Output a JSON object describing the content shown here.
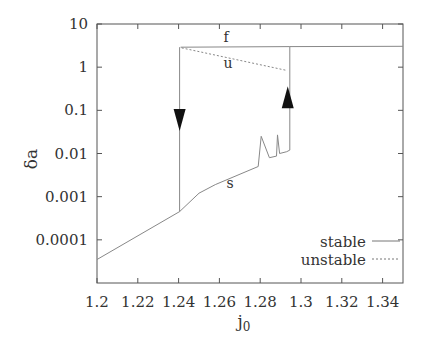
{
  "chart_data": {
    "type": "line",
    "title": "",
    "xlabel": "j0",
    "xlabel_main": "j",
    "xlabel_sub": "0",
    "ylabel": "δa",
    "xscale": "linear",
    "yscale": "log",
    "xlim": [
      1.2,
      1.35
    ],
    "ylim": [
      1e-05,
      10
    ],
    "x_ticks": [
      1.2,
      1.22,
      1.24,
      1.26,
      1.28,
      1.3,
      1.32,
      1.34
    ],
    "x_tick_labels": [
      "1.2",
      "1.22",
      "1.24",
      "1.26",
      "1.28",
      "1.3",
      "1.32",
      "1.34"
    ],
    "y_ticks": [
      10,
      1,
      0.1,
      0.01,
      0.001,
      0.0001
    ],
    "y_tick_labels": [
      "10",
      "1",
      "0.1",
      "0.01",
      "0.001",
      "0.0001"
    ],
    "grid": false,
    "legend_position": "lower right",
    "legend": [
      {
        "label": "stable",
        "style": "solid"
      },
      {
        "label": "unstable",
        "style": "dashed"
      }
    ],
    "series": [
      {
        "name": "s",
        "branch_label": "s",
        "style": "solid",
        "x": [
          1.2,
          1.2405,
          1.25,
          1.258,
          1.279,
          1.2805,
          1.2845,
          1.288,
          1.2885,
          1.2895,
          1.293,
          1.2945
        ],
        "y": [
          3.5e-05,
          0.00045,
          0.0012,
          0.0019,
          0.005,
          0.025,
          0.008,
          0.0087,
          0.027,
          0.01,
          0.011,
          0.012
        ]
      },
      {
        "name": "f",
        "branch_label": "f",
        "style": "solid",
        "x": [
          1.241,
          1.2945,
          1.35
        ],
        "y": [
          2.9,
          3.0,
          3.05
        ]
      },
      {
        "name": "u",
        "branch_label": "u",
        "style": "dashed",
        "x": [
          1.2415,
          1.2925
        ],
        "y": [
          2.8,
          0.85
        ]
      },
      {
        "name": "jump-down",
        "style": "solid",
        "x": [
          1.2405,
          1.2405
        ],
        "y": [
          2.9,
          0.00045
        ]
      },
      {
        "name": "jump-up",
        "style": "solid",
        "x": [
          1.2945,
          1.2945
        ],
        "y": [
          0.012,
          3.0
        ]
      }
    ],
    "annotations": [
      {
        "type": "arrow",
        "direction": "down",
        "x": 1.2405,
        "y": 0.06
      },
      {
        "type": "arrow",
        "direction": "up",
        "x": 1.2935,
        "y": 0.2
      },
      {
        "type": "text",
        "text": "f",
        "x": 1.2625,
        "y": 4.5
      },
      {
        "type": "text",
        "text": "u",
        "x": 1.2625,
        "y": 1.3
      },
      {
        "type": "text",
        "text": "s",
        "x": 1.2625,
        "y": 0.0022
      }
    ]
  }
}
